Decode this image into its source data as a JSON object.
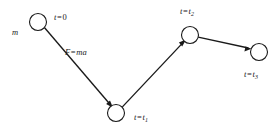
{
  "figure": {
    "name": "particle-trajectory-diagram",
    "background_color": "#ffffff",
    "stroke_color": "#1a1a1a",
    "labels": {
      "t0": "t = 0",
      "mass": "m",
      "force": "F = ma",
      "t1": "t = t1",
      "t2": "t = t2",
      "t3": "t = t3"
    },
    "label_parts": {
      "t_symbol": "t",
      "equals": "=",
      "zero": "0",
      "mass_symbol": "m",
      "force_symbol": "F",
      "force_expr": "ma",
      "sub1": "1",
      "sub2": "2",
      "sub3": "3"
    },
    "nodes": [
      {
        "id": "node-t0",
        "label": "t = 0",
        "cx": 38,
        "cy": 22,
        "r": 8.5
      },
      {
        "id": "node-t1",
        "label": "t = t1",
        "cx": 116,
        "cy": 113,
        "r": 8.5
      },
      {
        "id": "node-t2",
        "label": "t = t2",
        "cx": 190,
        "cy": 35,
        "r": 8.5
      },
      {
        "id": "node-t3",
        "label": "t = t3",
        "cx": 259,
        "cy": 52,
        "r": 8.5
      }
    ],
    "segments": [
      {
        "id": "segment-0-1",
        "from": "node-t0",
        "to": "node-t1",
        "label": "F = ma",
        "arrow": true
      },
      {
        "id": "segment-1-2",
        "from": "node-t1",
        "to": "node-t2",
        "label": "",
        "arrow": true
      },
      {
        "id": "segment-2-3",
        "from": "node-t2",
        "to": "node-t3",
        "label": "",
        "arrow": true
      }
    ]
  }
}
